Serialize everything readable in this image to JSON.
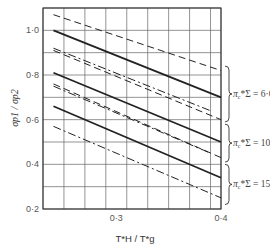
{
  "chart_data": {
    "type": "line",
    "title": "",
    "xlabel": "T*H / T*g",
    "ylabel": "σp1 / σp2",
    "xlim": [
      0.23,
      0.4
    ],
    "ylim": [
      0.2,
      1.1
    ],
    "grid": true,
    "x_ticks": [
      {
        "value": 0.3,
        "label": "0·3"
      },
      {
        "value": 0.4,
        "label": "0·4"
      }
    ],
    "y_ticks": [
      {
        "value": 1.0,
        "label": "1·0"
      },
      {
        "value": 0.8,
        "label": "0·8"
      },
      {
        "value": 0.6,
        "label": "0·6"
      },
      {
        "value": 0.4,
        "label": "0·4"
      },
      {
        "value": 0.2,
        "label": "0·2"
      }
    ],
    "x_grid": [
      0.23,
      0.25,
      0.27,
      0.29,
      0.31,
      0.33,
      0.35,
      0.37,
      0.39,
      0.4
    ],
    "y_grid": [
      0.2,
      0.3,
      0.4,
      0.5,
      0.6,
      0.7,
      0.8,
      0.9,
      1.0,
      1.1
    ],
    "groups": [
      {
        "label_main": "π",
        "label_sub": "c",
        "label_rest": "*Σ = 6·0",
        "y_range": [
          0.59,
          0.84
        ]
      },
      {
        "label_main": "π",
        "label_sub": "c",
        "label_rest": "*Σ = 10",
        "y_range": [
          0.41,
          0.58
        ]
      },
      {
        "label_main": "π",
        "label_sub": "c",
        "label_rest": "*Σ = 15",
        "y_range": [
          0.22,
          0.4
        ]
      }
    ],
    "series": [
      {
        "name": "6.0 dashed",
        "style": "dashed",
        "x": [
          0.24,
          0.4
        ],
        "values": [
          1.07,
          0.82
        ]
      },
      {
        "name": "6.0 solid",
        "style": "solid",
        "x": [
          0.24,
          0.4
        ],
        "values": [
          1.0,
          0.7
        ]
      },
      {
        "name": "6.0 dash-dot",
        "style": "dashdot",
        "x": [
          0.24,
          0.39
        ],
        "values": [
          0.92,
          0.64
        ]
      },
      {
        "name": "10 dashed",
        "style": "dashed",
        "x": [
          0.24,
          0.4
        ],
        "values": [
          0.91,
          0.6
        ]
      },
      {
        "name": "10 solid",
        "style": "solid",
        "x": [
          0.24,
          0.4
        ],
        "values": [
          0.81,
          0.5
        ]
      },
      {
        "name": "10 dashed-2",
        "style": "dashed",
        "x": [
          0.24,
          0.4
        ],
        "values": [
          0.76,
          0.43
        ]
      },
      {
        "name": "10 dash-dot",
        "style": "dashdot",
        "x": [
          0.24,
          0.39
        ],
        "values": [
          0.75,
          0.45
        ]
      },
      {
        "name": "15 solid",
        "style": "solid",
        "x": [
          0.24,
          0.4
        ],
        "values": [
          0.66,
          0.34
        ]
      },
      {
        "name": "15 dash-dot",
        "style": "dashdot",
        "x": [
          0.24,
          0.4
        ],
        "values": [
          0.57,
          0.25
        ]
      }
    ]
  }
}
